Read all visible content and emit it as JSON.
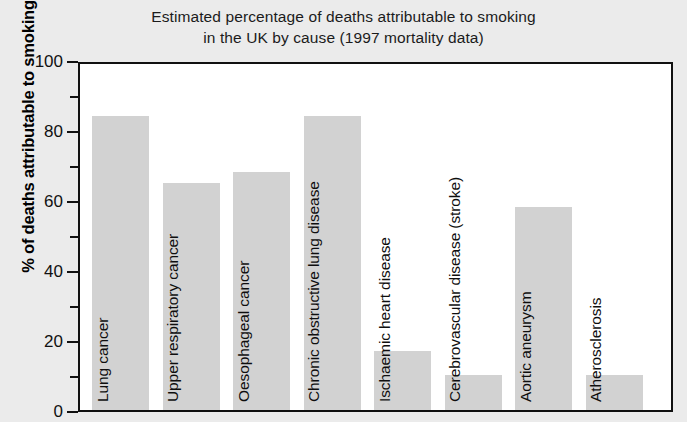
{
  "chart_data": {
    "type": "bar",
    "title": "Estimated percentage of deaths attributable to smoking in the UK by cause (1997 mortality data)",
    "title_lines": [
      "Estimated percentage of deaths attributable to smoking",
      "in the UK by cause (1997 mortality data)"
    ],
    "xlabel": "",
    "ylabel": "% of deaths attributable to smoking",
    "ylim": [
      0,
      100
    ],
    "ytick_major": [
      0,
      20,
      40,
      60,
      80,
      100
    ],
    "ytick_minor": [
      10,
      30,
      50,
      70,
      90
    ],
    "grid": false,
    "legend": false,
    "bar_color": "#d2d2d2",
    "frame_color": "#111111",
    "plot_background": "#ffffff",
    "figure_background": "#ebebeb",
    "categories": [
      "Lung cancer",
      "Upper respiratory cancer",
      "Oesophageal cancer",
      "Chronic obstructive lung disease",
      "Ischaemic heart disease",
      "Cerebrovascular disease (stroke)",
      "Aortic aneurysm",
      "Atherosclerosis"
    ],
    "values": [
      84,
      65,
      68,
      84,
      17,
      10,
      58,
      10
    ]
  }
}
